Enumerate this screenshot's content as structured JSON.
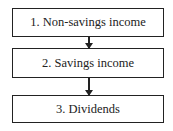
{
  "diagram": {
    "type": "flowchart",
    "direction": "top-to-bottom",
    "nodes": [
      {
        "id": "n1",
        "label": "1. Non-savings income"
      },
      {
        "id": "n2",
        "label": "2. Savings income"
      },
      {
        "id": "n3",
        "label": "3. Dividends"
      }
    ],
    "edges": [
      {
        "from": "n1",
        "to": "n2"
      },
      {
        "from": "n2",
        "to": "n3"
      }
    ]
  }
}
